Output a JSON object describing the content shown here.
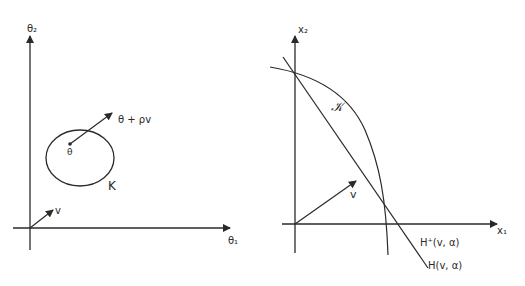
{
  "left_panel": {
    "y_axis_label": "θ₂",
    "x_axis_label": "θ₁",
    "point_label": "θ",
    "arrow_tip_label": "θ + ρv",
    "set_label": "K",
    "vector_label": "v"
  },
  "right_panel": {
    "y_axis_label": "x₂",
    "x_axis_label": "x₁",
    "set_label": "𝒦",
    "vector_label": "v",
    "halfspace_label": "H⁺(v, α)",
    "hyperplane_label": "H(v, α)"
  },
  "colors": {
    "ink": "#2a2a2a",
    "background": "#ffffff"
  }
}
